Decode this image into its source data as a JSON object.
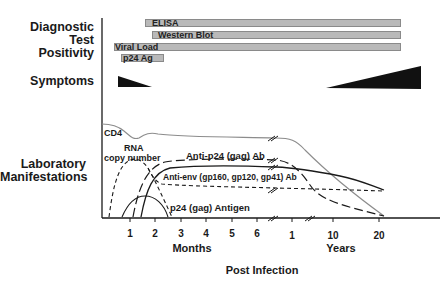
{
  "sections": {
    "diagnostic": "Diagnostic\nTest\nPositivity",
    "diagnostic_lines": [
      "Diagnostic",
      "Test",
      "Positivity"
    ],
    "symptoms": "Symptoms",
    "laboratory_lines": [
      "Laboratory",
      "Manifestations"
    ]
  },
  "tests": [
    {
      "label": "ELISA",
      "x_start": 145,
      "x_end": 400,
      "y": 20
    },
    {
      "label": "Western Blot",
      "x_start": 152,
      "x_end": 400,
      "y": 32
    },
    {
      "label": "Viral Load",
      "x_start": 114,
      "x_end": 400,
      "y": 43
    },
    {
      "label": "p24 Ag",
      "x_start": 121,
      "x_end": 164,
      "y": 54
    }
  ],
  "curves": {
    "cd4": "CD4",
    "rna_line1": "RNA",
    "rna_line2": "copy number",
    "anti_p24": "Anti-p24 (gag) Ab",
    "anti_env": "Anti-env (gp160, gp120, gp41) Ab",
    "p24_antigen": "p24 (gag) Antigen"
  },
  "axis": {
    "months_ticks": [
      "1",
      "2",
      "3",
      "4",
      "5",
      "6"
    ],
    "years_ticks": [
      "1",
      "10",
      "20"
    ],
    "months_label": "Months",
    "years_label": "Years",
    "title": "Post Infection"
  },
  "colors": {
    "bar_fill": "#b9b9b9",
    "bar_border": "#8a8a8a",
    "ink": "#1a1a1a",
    "cd4_line": "#8c8c8c"
  }
}
